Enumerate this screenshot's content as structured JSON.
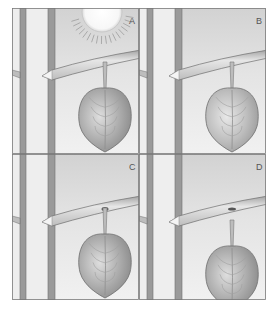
{
  "figure": {
    "panels": [
      {
        "label": "A",
        "has_sun": true,
        "petiole_state": "attached",
        "leaf_shade": "#a9a9a9"
      },
      {
        "label": "B",
        "has_sun": false,
        "petiole_state": "attached",
        "leaf_shade": "#b8b8b8"
      },
      {
        "label": "C",
        "has_sun": false,
        "petiole_state": "abscission-layer",
        "leaf_shade": "#a9a9a9"
      },
      {
        "label": "D",
        "has_sun": false,
        "petiole_state": "detached",
        "leaf_shade": "#a4a4a4"
      }
    ]
  },
  "colors": {
    "background": "#eeeeee",
    "sky_top": "#d6d6d6",
    "trunk": "#9a9a9a",
    "trunk_edge": "#6f6f6f",
    "branch": "#d8d8d8",
    "leaf_light": "#d2d2d2",
    "leaf_dark": "#8c8c8c",
    "sun": "#ffffff",
    "border": "#7a7a7a"
  }
}
